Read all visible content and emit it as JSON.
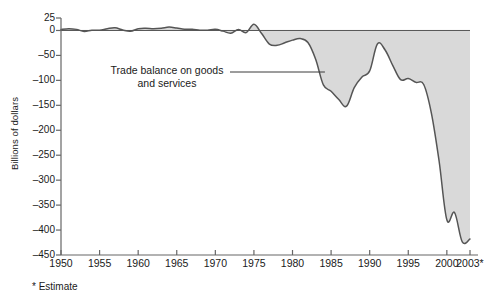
{
  "chart_data": {
    "type": "area",
    "title": "",
    "xlabel": "",
    "ylabel": "Billions of dollars",
    "ylim": [
      -450,
      25
    ],
    "xlim": [
      1950,
      2003
    ],
    "grid": false,
    "legend": "none",
    "annotations": [
      {
        "text_line1": "Trade balance on goods",
        "text_line2": "and services",
        "points_to_year": 1984
      }
    ],
    "footnote": "* Estimate",
    "ytick_labels": [
      "25",
      "0",
      "–50",
      "–100",
      "–150",
      "–200",
      "–250",
      "–300",
      "–350",
      "–400",
      "–450"
    ],
    "ytick_values": [
      25,
      0,
      -50,
      -100,
      -150,
      -200,
      -250,
      -300,
      -350,
      -400,
      -450
    ],
    "xtick_labels": [
      "1950",
      "1955",
      "1960",
      "1965",
      "1970",
      "1975",
      "1980",
      "1985",
      "1990",
      "1995",
      "2000",
      "2003*"
    ],
    "xtick_values": [
      1950,
      1955,
      1960,
      1965,
      1970,
      1975,
      1980,
      1985,
      1990,
      1995,
      2000,
      2003
    ],
    "series": [
      {
        "name": "Trade balance on goods and services",
        "line_color": "#555555",
        "fill_color": "#d9d9d9",
        "x": [
          1950,
          1951,
          1952,
          1953,
          1954,
          1955,
          1956,
          1957,
          1958,
          1959,
          1960,
          1961,
          1962,
          1963,
          1964,
          1965,
          1966,
          1967,
          1968,
          1969,
          1970,
          1971,
          1972,
          1973,
          1974,
          1975,
          1976,
          1977,
          1978,
          1979,
          1980,
          1981,
          1982,
          1983,
          1984,
          1985,
          1986,
          1987,
          1988,
          1989,
          1990,
          1991,
          1992,
          1993,
          1994,
          1995,
          1996,
          1997,
          1998,
          1999,
          2000,
          2001,
          2002,
          2003
        ],
        "values": [
          1.8,
          3.7,
          2.2,
          -1.9,
          0.6,
          0.4,
          3.5,
          5.3,
          1.0,
          -1.5,
          3.5,
          4.3,
          3.4,
          4.4,
          6.8,
          4.9,
          2.5,
          2.6,
          0.6,
          0.6,
          2.3,
          -1.3,
          -5.4,
          1.9,
          -4.3,
          12.4,
          -6.1,
          -27.2,
          -29.8,
          -24.6,
          -19.4,
          -16.2,
          -24.2,
          -57.8,
          -109.1,
          -121.9,
          -138.5,
          -151.7,
          -114.6,
          -93.1,
          -81.1,
          -27.0,
          -39.2,
          -70.3,
          -98.5,
          -96.4,
          -104.1,
          -108.3,
          -166.1,
          -262.1,
          -379.5,
          -365.1,
          -423.7,
          -418.0
        ]
      }
    ]
  },
  "axes": {
    "y_axis_label": "Billions of dollars",
    "x_axis_label": ""
  },
  "annotation": {
    "line1": "Trade balance on goods",
    "line2": "and services"
  },
  "footnote": {
    "text": "* Estimate"
  },
  "colors": {
    "fill": "#d9d9d9",
    "line": "#555555",
    "axis": "#666666",
    "text": "#1a1a1a"
  }
}
